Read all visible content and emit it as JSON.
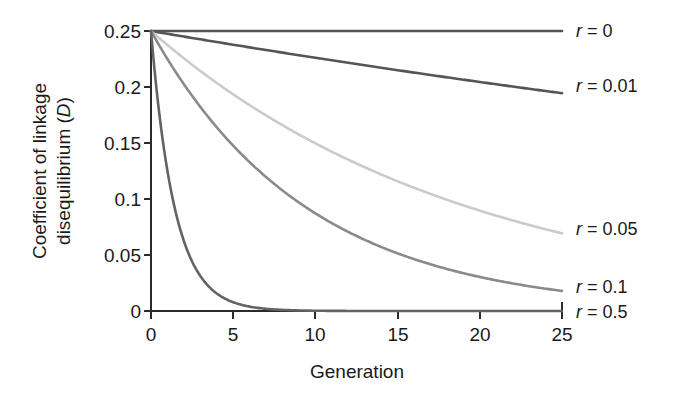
{
  "chart_data": {
    "type": "line",
    "title": "",
    "xlabel": "Generation",
    "ylabel": "Coefficient of linkage disequilibrium (D)",
    "ylabel_line1": "Coefficient of linkage",
    "ylabel_line2_prefix": "disequilibrium (",
    "ylabel_line2_italic": "D",
    "ylabel_line2_suffix": ")",
    "xlim": [
      0,
      25
    ],
    "ylim": [
      0,
      0.25
    ],
    "grid": false,
    "legend_position": "right-inline",
    "xticks": [
      0,
      5,
      10,
      15,
      20,
      25
    ],
    "xtick_labels": [
      "0",
      "5",
      "10",
      "15",
      "20",
      "25"
    ],
    "yticks": [
      0,
      0.05,
      0.1,
      0.15,
      0.2,
      0.25
    ],
    "ytick_labels": [
      "0",
      "0.05",
      "0.1",
      "0.15",
      "0.2",
      "0.25"
    ],
    "x": [
      0,
      1,
      2,
      3,
      4,
      5,
      6,
      7,
      8,
      9,
      10,
      11,
      12,
      13,
      14,
      15,
      16,
      17,
      18,
      19,
      20,
      21,
      22,
      23,
      24,
      25
    ],
    "series": [
      {
        "name": "r = 0",
        "label_prefix": "r",
        "label_suffix": " = 0",
        "r": 0,
        "color": "#555555",
        "values": [
          0.25,
          0.25,
          0.25,
          0.25,
          0.25,
          0.25,
          0.25,
          0.25,
          0.25,
          0.25,
          0.25,
          0.25,
          0.25,
          0.25,
          0.25,
          0.25,
          0.25,
          0.25,
          0.25,
          0.25,
          0.25,
          0.25,
          0.25,
          0.25,
          0.25,
          0.25
        ]
      },
      {
        "name": "r = 0.01",
        "label_prefix": "r",
        "label_suffix": " = 0.01",
        "r": 0.01,
        "color": "#555555",
        "values": [
          0.25,
          0.2475,
          0.245,
          0.2426,
          0.2402,
          0.2378,
          0.2354,
          0.233,
          0.2307,
          0.2284,
          0.2261,
          0.2238,
          0.2216,
          0.2194,
          0.2172,
          0.215,
          0.2129,
          0.2107,
          0.2086,
          0.2065,
          0.2045,
          0.2024,
          0.2004,
          0.1984,
          0.1964,
          0.1945
        ]
      },
      {
        "name": "r = 0.05",
        "label_prefix": "r",
        "label_suffix": " = 0.05",
        "r": 0.05,
        "color": "#cbcbcb",
        "values": [
          0.25,
          0.2375,
          0.2256,
          0.2143,
          0.2036,
          0.1934,
          0.1838,
          0.1746,
          0.1659,
          0.1576,
          0.1497,
          0.1422,
          0.1351,
          0.1283,
          0.1219,
          0.1158,
          0.11,
          0.1045,
          0.0993,
          0.0943,
          0.0896,
          0.0851,
          0.0809,
          0.0768,
          0.073,
          0.0693
        ]
      },
      {
        "name": "r = 0.1",
        "label_prefix": "r",
        "label_suffix": " = 0.1",
        "r": 0.1,
        "color": "#8a8a8a",
        "values": [
          0.25,
          0.225,
          0.2025,
          0.1823,
          0.164,
          0.1476,
          0.1329,
          0.1196,
          0.1076,
          0.0969,
          0.0872,
          0.0784,
          0.0706,
          0.0635,
          0.0572,
          0.0515,
          0.0463,
          0.0417,
          0.0375,
          0.0338,
          0.0304,
          0.0273,
          0.0246,
          0.0221,
          0.0199,
          0.0179
        ]
      },
      {
        "name": "r = 0.5",
        "label_prefix": "r",
        "label_suffix": " = 0.5",
        "r": 0.5,
        "color": "#636363",
        "values": [
          0.25,
          0.125,
          0.0625,
          0.0313,
          0.0156,
          0.0078,
          0.0039,
          0.002,
          0.001,
          0.0005,
          0.0002,
          0.0001,
          0.0001,
          0.0,
          0.0,
          0.0,
          0.0,
          0.0,
          0.0,
          0.0,
          0.0,
          0.0,
          0.0,
          0.0,
          0.0,
          0.0
        ]
      }
    ],
    "legend_labels": [
      "r = 0",
      "r = 0.01",
      "r = 0.05",
      "r = 0.1",
      "r = 0.5"
    ],
    "axis_color": "#2b2b2b",
    "background_color": "#ffffff"
  }
}
